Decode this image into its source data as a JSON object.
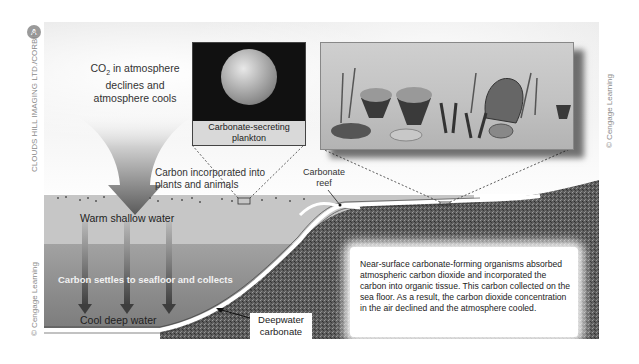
{
  "figure": {
    "panel_badge": "A",
    "credits": {
      "left_top": "CLOUDS HILL IMAGING LTD./CORBIS",
      "left_bottom": "© Cengage Learning",
      "right": "© Cengage Learning"
    },
    "atmosphere": {
      "co2_label_prefix": "CO",
      "co2_label_sub": "2",
      "co2_label_rest": " in atmosphere",
      "co2_line2": "declines and",
      "co2_line3": "atmosphere cools"
    },
    "plankton": {
      "caption_line1": "Carbonate-secreting",
      "caption_line2": "plankton"
    },
    "labels": {
      "incorporated_line1": "Carbon incorporated into",
      "incorporated_line2": "plants and animals",
      "reef_line1": "Carbonate",
      "reef_line2": "reef",
      "warm_water": "Warm shallow water",
      "settles": "Carbon settles to seafloor and collects",
      "cool_water": "Cool deep water",
      "deepwater_line1": "Deepwater",
      "deepwater_line2": "carbonate"
    },
    "info_text": "Near-surface carbonate-forming organisms absorbed atmospheric carbon dioxide and incorporated the carbon into organic tissue. This carbon collected on the sea floor. As a result, the carbon dioxide concentration in the air declined and the atmosphere cooled.",
    "colors": {
      "sky": "#efefef",
      "shallow_water": "#c6c6c6",
      "deep_water": "#858585",
      "seafloor": "#5a5a5a",
      "arrow": "#5e5e5e"
    }
  }
}
